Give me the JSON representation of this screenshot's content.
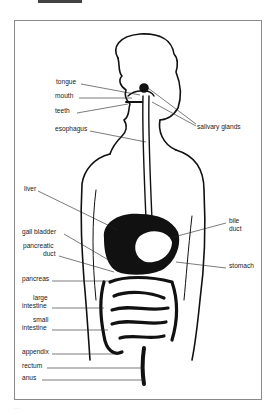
{
  "diagram": {
    "frame_color": "#8a8a8a",
    "ink_color": "#111111",
    "labels_left": [
      {
        "id": "tongue",
        "text": "tongue",
        "x": 56,
        "y": 81
      },
      {
        "id": "mouth",
        "text": "mouth",
        "x": 55,
        "y": 95
      },
      {
        "id": "teeth",
        "text": "teeth",
        "x": 55,
        "y": 110
      },
      {
        "id": "esophagus",
        "text": "esophagus",
        "x": 55,
        "y": 128
      },
      {
        "id": "liver",
        "text": "liver",
        "x": 24,
        "y": 188
      },
      {
        "id": "gall-bladder",
        "text": "gall bladder",
        "x": 22,
        "y": 231
      },
      {
        "id": "pancreatic-duct-1",
        "text": "pancreatic",
        "x": 23,
        "y": 245
      },
      {
        "id": "pancreatic-duct-2",
        "text": "duct",
        "x": 43,
        "y": 253
      },
      {
        "id": "pancreas",
        "text": "pancreas",
        "x": 22,
        "y": 278
      },
      {
        "id": "large-intestine-1",
        "text": "large",
        "x": 33,
        "y": 297
      },
      {
        "id": "large-intestine-2",
        "text": "intestine",
        "x": 22,
        "y": 305
      },
      {
        "id": "small-intestine-1",
        "text": "small",
        "x": 33,
        "y": 319
      },
      {
        "id": "small-intestine-2",
        "text": "intestine",
        "x": 22,
        "y": 327
      },
      {
        "id": "appendix",
        "text": "appendix",
        "x": 22,
        "y": 351
      },
      {
        "id": "rectum",
        "text": "rectum",
        "x": 22,
        "y": 365
      },
      {
        "id": "anus",
        "text": "anus",
        "x": 22,
        "y": 377
      }
    ],
    "labels_right": [
      {
        "id": "salivary-glands",
        "text": "salivary glands",
        "x": 197,
        "y": 126
      },
      {
        "id": "bile-duct-1",
        "text": "bile",
        "x": 229,
        "y": 220
      },
      {
        "id": "bile-duct-2",
        "text": "duct",
        "x": 229,
        "y": 228
      },
      {
        "id": "stomach",
        "text": "stomach",
        "x": 229,
        "y": 265
      }
    ]
  },
  "caption": "..."
}
